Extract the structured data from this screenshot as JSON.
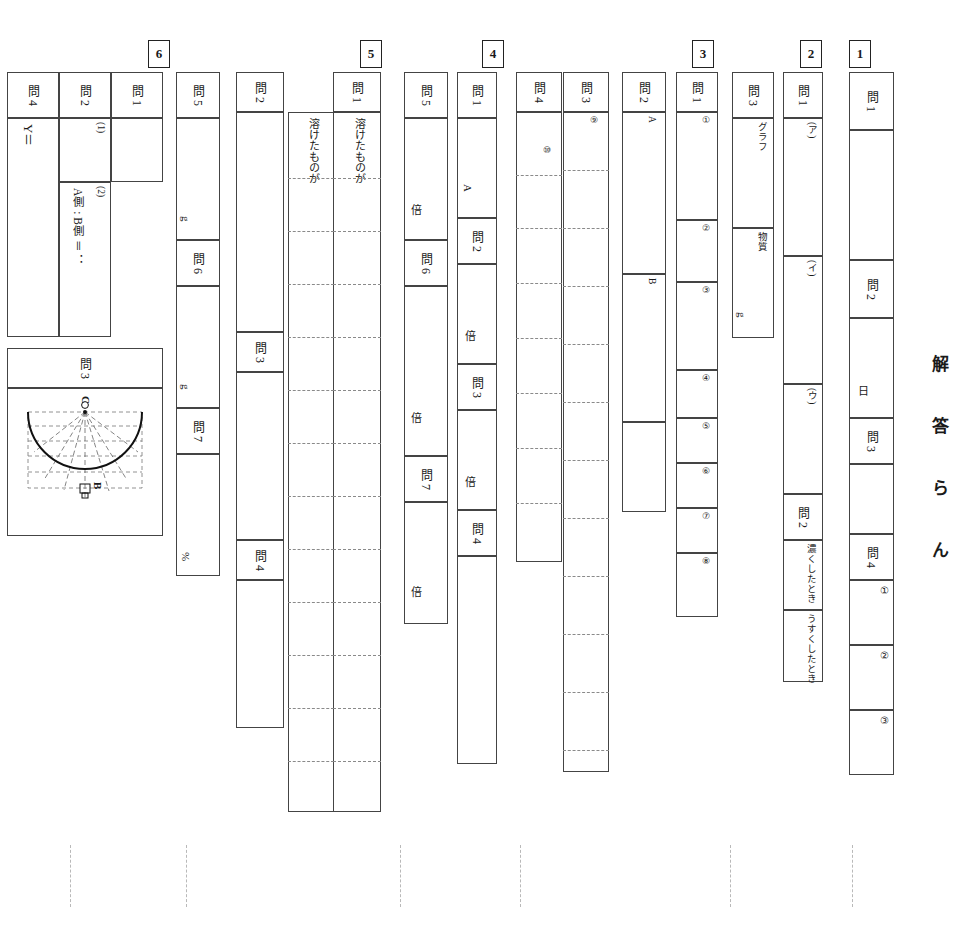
{
  "sheet": {
    "title": "解 答 ら ん",
    "orientation": "rotated-90"
  },
  "sections": [
    {
      "number": "1",
      "rows": [
        {
          "label": "問 1",
          "sub": [
            ""
          ],
          "units": [
            ""
          ]
        },
        {
          "label": "問 2",
          "sub": [
            ""
          ],
          "units": [
            "日"
          ]
        },
        {
          "label": "問 3",
          "sub": [
            ""
          ],
          "units": [
            ""
          ]
        },
        {
          "label": "問 4",
          "sub": [
            "①",
            "②",
            "③"
          ],
          "units": [
            "",
            "",
            ""
          ]
        }
      ]
    },
    {
      "number": "2",
      "rows": [
        {
          "label": "問 1",
          "sub": [
            "(ア)",
            "(イ)",
            "(ウ)"
          ],
          "units": [
            "",
            "",
            ""
          ]
        },
        {
          "label": "問 2",
          "sub": [
            "濃くしたとき",
            "うすくしたとき"
          ],
          "units": [
            "",
            ""
          ]
        },
        {
          "label": "問 3",
          "sub": [
            "グラフ",
            "物質"
          ],
          "units": [
            "",
            "g"
          ]
        }
      ]
    },
    {
      "number": "3",
      "rows": [
        {
          "label": "問 1",
          "sub": [
            "①",
            "②",
            "③",
            "④",
            "⑤",
            "⑥",
            "⑦",
            "⑧"
          ],
          "units": [
            "",
            "",
            "",
            "",
            "",
            "",
            "",
            ""
          ]
        },
        {
          "label": "問 2",
          "sub": [
            "A",
            "B"
          ],
          "units": [
            "",
            ""
          ]
        },
        {
          "label": "問 3",
          "sub": [
            "⑨"
          ],
          "units": [
            ""
          ]
        },
        {
          "label": "問 4",
          "sub": [
            "⑩"
          ],
          "units": [
            ""
          ]
        }
      ]
    },
    {
      "number": "4",
      "rows": [
        {
          "label": "問 1",
          "sub": [
            ""
          ],
          "units": [
            "A"
          ]
        },
        {
          "label": "問 2",
          "sub": [
            ""
          ],
          "units": [
            "倍"
          ]
        },
        {
          "label": "問 3",
          "sub": [
            ""
          ],
          "units": [
            "倍"
          ]
        },
        {
          "label": "問 4",
          "sub": [
            ""
          ],
          "units": [
            ""
          ]
        },
        {
          "label": "問 5",
          "sub": [
            ""
          ],
          "units": [
            "倍"
          ]
        },
        {
          "label": "問 6",
          "sub": [
            ""
          ],
          "units": [
            "倍"
          ]
        },
        {
          "label": "問 7",
          "sub": [
            ""
          ],
          "units": [
            "倍"
          ]
        }
      ]
    },
    {
      "number": "5",
      "rows": [
        {
          "label": "問 1",
          "sub": [
            "溶けたものが",
            "溶けたものが"
          ],
          "units": [
            "",
            ""
          ]
        },
        {
          "label": "問 2",
          "sub": [
            ""
          ],
          "units": [
            ""
          ]
        },
        {
          "label": "問 3",
          "sub": [
            ""
          ],
          "units": [
            ""
          ]
        },
        {
          "label": "問 4",
          "sub": [
            ""
          ],
          "units": [
            ""
          ]
        },
        {
          "label": "問 5",
          "sub": [
            ""
          ],
          "units": [
            "g"
          ]
        },
        {
          "label": "問 6",
          "sub": [
            ""
          ],
          "units": [
            "g"
          ]
        },
        {
          "label": "問 7",
          "sub": [
            ""
          ],
          "units": [
            "%"
          ]
        }
      ]
    },
    {
      "number": "6",
      "rows": [
        {
          "label": "問 1",
          "sub": [
            ""
          ],
          "units": [
            ""
          ]
        },
        {
          "label": "問 2",
          "sub": [
            "(1)",
            "(2)"
          ],
          "units": [
            "",
            "A側 : B側 ＝          ："
          ]
        },
        {
          "label": "問 3",
          "sub": [
            ""
          ],
          "units": [
            ""
          ]
        },
        {
          "label": "問 4",
          "sub": [
            ""
          ],
          "units": [
            "Y＝"
          ]
        }
      ]
    }
  ],
  "figure": {
    "name": "semicircle-diagram",
    "point_top": "C",
    "point_bottom": "B"
  }
}
